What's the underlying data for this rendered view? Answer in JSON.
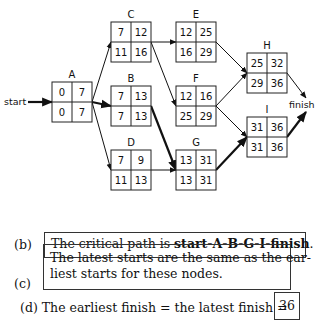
{
  "diagram": {
    "start_label": "start",
    "finish_label": "finish",
    "nodes": [
      {
        "id": "A",
        "label": "A",
        "x": 52,
        "y": 82,
        "es": "0",
        "ef": "7",
        "ls": "0",
        "lf": "7"
      },
      {
        "id": "C",
        "label": "C",
        "x": 111,
        "y": 22,
        "es": "7",
        "ef": "12",
        "ls": "11",
        "lf": "16"
      },
      {
        "id": "B",
        "label": "B",
        "x": 111,
        "y": 86,
        "es": "7",
        "ef": "13",
        "ls": "7",
        "lf": "13"
      },
      {
        "id": "D",
        "label": "D",
        "x": 111,
        "y": 150,
        "es": "7",
        "ef": "9",
        "ls": "11",
        "lf": "13"
      },
      {
        "id": "E",
        "label": "E",
        "x": 176,
        "y": 22,
        "es": "12",
        "ef": "25",
        "ls": "16",
        "lf": "29"
      },
      {
        "id": "F",
        "label": "F",
        "x": 176,
        "y": 86,
        "es": "12",
        "ef": "16",
        "ls": "25",
        "lf": "29"
      },
      {
        "id": "G",
        "label": "G",
        "x": 176,
        "y": 150,
        "es": "13",
        "ef": "31",
        "ls": "13",
        "lf": "31"
      },
      {
        "id": "H",
        "label": "H",
        "x": 247,
        "y": 53,
        "es": "25",
        "ef": "32",
        "ls": "29",
        "lf": "36"
      },
      {
        "id": "I",
        "label": "I",
        "x": 247,
        "y": 117,
        "es": "31",
        "ef": "36",
        "ls": "31",
        "lf": "36"
      }
    ],
    "edges": [
      {
        "from": "start",
        "to": "A",
        "critical": true
      },
      {
        "from": "A",
        "to": "C",
        "critical": false
      },
      {
        "from": "A",
        "to": "B",
        "critical": true
      },
      {
        "from": "A",
        "to": "D",
        "critical": false
      },
      {
        "from": "C",
        "to": "E",
        "critical": false
      },
      {
        "from": "C",
        "to": "F",
        "critical": false
      },
      {
        "from": "B",
        "to": "G",
        "critical": true
      },
      {
        "from": "D",
        "to": "G",
        "critical": false
      },
      {
        "from": "E",
        "to": "H",
        "critical": false
      },
      {
        "from": "F",
        "to": "H",
        "critical": false
      },
      {
        "from": "F",
        "to": "I",
        "critical": false
      },
      {
        "from": "G",
        "to": "I",
        "critical": true
      },
      {
        "from": "H",
        "to": "finish",
        "critical": false
      },
      {
        "from": "I",
        "to": "finish",
        "critical": true
      }
    ]
  },
  "answers": {
    "b": {
      "tag": "(b)",
      "text_prefix": "The critical path is ",
      "text_bold": "start-A-B-G-I-finish",
      "text_suffix": "."
    },
    "c": {
      "tag": "(c)",
      "line1": "The latest starts are the same as the ear-",
      "line2": "liest starts for these nodes."
    },
    "d": {
      "tag": "(d)",
      "text": "The earliest finish = the latest finish =",
      "value": "36"
    }
  }
}
